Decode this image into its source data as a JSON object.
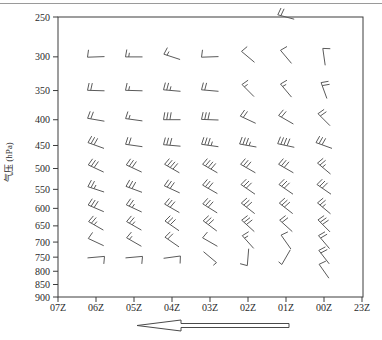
{
  "colors": {
    "background": "#ffffff",
    "axis": "#3c3c3c",
    "barb": "#5a5a5a",
    "label": "#2a2a2a",
    "top_rule": "#9a9a9a",
    "arrow_fill": "#ffffff",
    "arrow_stroke": "#4a4a4a"
  },
  "chart_data": {
    "type": "wind-barb-time-height-profile",
    "title": "",
    "xlabel": "",
    "ylabel": "气压 (hPa)",
    "y_scale": "log",
    "y_ticks": [
      250,
      300,
      350,
      400,
      450,
      500,
      550,
      600,
      650,
      700,
      750,
      800,
      850,
      900
    ],
    "x_ticks": [
      "07Z",
      "06Z",
      "05Z",
      "04Z",
      "03Z",
      "02Z",
      "01Z",
      "00Z",
      "23Z"
    ],
    "x_axis_note": "time runs right-to-left (newest 07Z at left, 23Z at right)",
    "arrow": {
      "direction": "left",
      "style": "hollow-outline"
    },
    "barbs": [
      {
        "t": "01Z",
        "p": 250,
        "dir": 285,
        "full": 2,
        "half": 0
      },
      {
        "t": "06Z",
        "p": 300,
        "dir": 268,
        "full": 1,
        "half": 0
      },
      {
        "t": "05Z",
        "p": 300,
        "dir": 270,
        "full": 1,
        "half": 1
      },
      {
        "t": "04Z",
        "p": 300,
        "dir": 288,
        "full": 1,
        "half": 1
      },
      {
        "t": "03Z",
        "p": 300,
        "dir": 268,
        "full": 1,
        "half": 0
      },
      {
        "t": "02Z",
        "p": 300,
        "dir": 310,
        "full": 1,
        "half": 0
      },
      {
        "t": "01Z",
        "p": 300,
        "dir": 320,
        "full": 1,
        "half": 0
      },
      {
        "t": "00Z",
        "p": 300,
        "dir": 352,
        "full": 1,
        "half": 0
      },
      {
        "t": "06Z",
        "p": 350,
        "dir": 272,
        "full": 2,
        "half": 0
      },
      {
        "t": "05Z",
        "p": 350,
        "dir": 272,
        "full": 1,
        "half": 1
      },
      {
        "t": "04Z",
        "p": 350,
        "dir": 275,
        "full": 2,
        "half": 1
      },
      {
        "t": "03Z",
        "p": 350,
        "dir": 275,
        "full": 2,
        "half": 0
      },
      {
        "t": "02Z",
        "p": 350,
        "dir": 315,
        "full": 1,
        "half": 1
      },
      {
        "t": "01Z",
        "p": 350,
        "dir": 320,
        "full": 1,
        "half": 1
      },
      {
        "t": "00Z",
        "p": 350,
        "dir": 340,
        "full": 2,
        "half": 0
      },
      {
        "t": "06Z",
        "p": 400,
        "dir": 280,
        "full": 2,
        "half": 0
      },
      {
        "t": "05Z",
        "p": 400,
        "dir": 278,
        "full": 1,
        "half": 1
      },
      {
        "t": "04Z",
        "p": 400,
        "dir": 270,
        "full": 3,
        "half": 0
      },
      {
        "t": "03Z",
        "p": 400,
        "dir": 272,
        "full": 3,
        "half": 0
      },
      {
        "t": "02Z",
        "p": 400,
        "dir": 295,
        "full": 2,
        "half": 0
      },
      {
        "t": "01Z",
        "p": 400,
        "dir": 300,
        "full": 2,
        "half": 0
      },
      {
        "t": "00Z",
        "p": 400,
        "dir": 315,
        "full": 2,
        "half": 0
      },
      {
        "t": "06Z",
        "p": 450,
        "dir": 290,
        "full": 3,
        "half": 0
      },
      {
        "t": "05Z",
        "p": 450,
        "dir": 278,
        "full": 2,
        "half": 0
      },
      {
        "t": "04Z",
        "p": 450,
        "dir": 275,
        "full": 3,
        "half": 0
      },
      {
        "t": "03Z",
        "p": 450,
        "dir": 278,
        "full": 3,
        "half": 1
      },
      {
        "t": "02Z",
        "p": 450,
        "dir": 280,
        "full": 3,
        "half": 1
      },
      {
        "t": "01Z",
        "p": 450,
        "dir": 282,
        "full": 4,
        "half": 0
      },
      {
        "t": "00Z",
        "p": 450,
        "dir": 290,
        "full": 3,
        "half": 0
      },
      {
        "t": "06Z",
        "p": 500,
        "dir": 295,
        "full": 3,
        "half": 0
      },
      {
        "t": "05Z",
        "p": 500,
        "dir": 295,
        "full": 3,
        "half": 0
      },
      {
        "t": "04Z",
        "p": 500,
        "dir": 300,
        "full": 4,
        "half": 0
      },
      {
        "t": "03Z",
        "p": 500,
        "dir": 300,
        "full": 4,
        "half": 0
      },
      {
        "t": "02Z",
        "p": 500,
        "dir": 300,
        "full": 3,
        "half": 0
      },
      {
        "t": "01Z",
        "p": 500,
        "dir": 300,
        "full": 3,
        "half": 0
      },
      {
        "t": "00Z",
        "p": 500,
        "dir": 310,
        "full": 2,
        "half": 1
      },
      {
        "t": "06Z",
        "p": 550,
        "dir": 288,
        "full": 2,
        "half": 1
      },
      {
        "t": "05Z",
        "p": 550,
        "dir": 290,
        "full": 3,
        "half": 0
      },
      {
        "t": "04Z",
        "p": 550,
        "dir": 295,
        "full": 3,
        "half": 0
      },
      {
        "t": "03Z",
        "p": 550,
        "dir": 300,
        "full": 3,
        "half": 0
      },
      {
        "t": "02Z",
        "p": 550,
        "dir": 305,
        "full": 3,
        "half": 0
      },
      {
        "t": "01Z",
        "p": 550,
        "dir": 305,
        "full": 3,
        "half": 0
      },
      {
        "t": "00Z",
        "p": 550,
        "dir": 305,
        "full": 3,
        "half": 0
      },
      {
        "t": "06Z",
        "p": 600,
        "dir": 293,
        "full": 3,
        "half": 0
      },
      {
        "t": "05Z",
        "p": 600,
        "dir": 295,
        "full": 2,
        "half": 1
      },
      {
        "t": "04Z",
        "p": 600,
        "dir": 300,
        "full": 3,
        "half": 0
      },
      {
        "t": "03Z",
        "p": 600,
        "dir": 302,
        "full": 3,
        "half": 0
      },
      {
        "t": "02Z",
        "p": 600,
        "dir": 308,
        "full": 3,
        "half": 0
      },
      {
        "t": "01Z",
        "p": 600,
        "dir": 308,
        "full": 3,
        "half": 0
      },
      {
        "t": "00Z",
        "p": 600,
        "dir": 310,
        "full": 2,
        "half": 1
      },
      {
        "t": "06Z",
        "p": 650,
        "dir": 300,
        "full": 2,
        "half": 1
      },
      {
        "t": "05Z",
        "p": 650,
        "dir": 300,
        "full": 2,
        "half": 1
      },
      {
        "t": "04Z",
        "p": 650,
        "dir": 305,
        "full": 3,
        "half": 0
      },
      {
        "t": "03Z",
        "p": 650,
        "dir": 307,
        "full": 3,
        "half": 0
      },
      {
        "t": "02Z",
        "p": 650,
        "dir": 312,
        "full": 3,
        "half": 0
      },
      {
        "t": "01Z",
        "p": 650,
        "dir": 312,
        "full": 2,
        "half": 0
      },
      {
        "t": "00Z",
        "p": 650,
        "dir": 315,
        "full": 3,
        "half": 0
      },
      {
        "t": "06Z",
        "p": 700,
        "dir": 295,
        "full": 1,
        "half": 0
      },
      {
        "t": "05Z",
        "p": 700,
        "dir": 300,
        "full": 1,
        "half": 1
      },
      {
        "t": "04Z",
        "p": 700,
        "dir": 305,
        "full": 2,
        "half": 0
      },
      {
        "t": "03Z",
        "p": 700,
        "dir": 300,
        "full": 1,
        "half": 0
      },
      {
        "t": "02Z",
        "p": 700,
        "dir": 318,
        "full": 1,
        "half": 1
      },
      {
        "t": "01Z",
        "p": 700,
        "dir": 325,
        "full": 1,
        "half": 0
      },
      {
        "t": "00Z",
        "p": 700,
        "dir": 320,
        "full": 2,
        "half": 0
      },
      {
        "t": "06Z",
        "p": 750,
        "dir": 85,
        "full": 1,
        "half": 0
      },
      {
        "t": "05Z",
        "p": 750,
        "dir": 85,
        "full": 1,
        "half": 0
      },
      {
        "t": "04Z",
        "p": 750,
        "dir": 82,
        "full": 1,
        "half": 0
      },
      {
        "t": "03Z",
        "p": 750,
        "dir": 130,
        "full": 0,
        "half": 1
      },
      {
        "t": "02Z",
        "p": 750,
        "dir": 185,
        "full": 1,
        "half": 0
      },
      {
        "t": "01Z",
        "p": 750,
        "dir": 210,
        "full": 0,
        "half": 1
      },
      {
        "t": "00Z",
        "p": 750,
        "dir": 322,
        "full": 2,
        "half": 0
      },
      {
        "t": "00Z",
        "p": 800,
        "dir": 325,
        "full": 1,
        "half": 0
      }
    ]
  }
}
